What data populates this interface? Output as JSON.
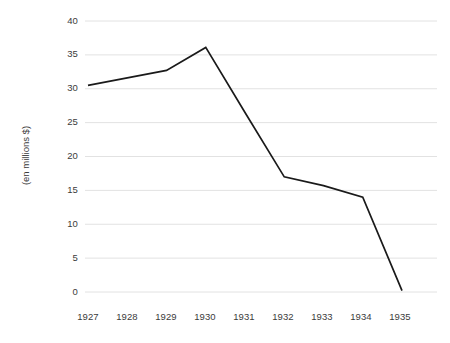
{
  "chart_data": {
    "type": "line",
    "title": "",
    "subtitle": "",
    "xlabel": "",
    "ylabel": "(en millions $)",
    "categories": [
      "1927",
      "1928",
      "1929",
      "1930",
      "1931",
      "1932",
      "1933",
      "1934",
      "1935"
    ],
    "x": [
      1927,
      1928,
      1929,
      1930,
      1931,
      1932,
      1933,
      1934,
      1935
    ],
    "values": [
      30.5,
      31.6,
      32.7,
      36.1,
      26.5,
      17.0,
      15.7,
      14.0,
      0.2
    ],
    "series": [
      {
        "name": "",
        "values": [
          30.5,
          31.6,
          32.7,
          36.1,
          26.5,
          17.0,
          15.7,
          14.0,
          0.2
        ]
      }
    ],
    "ylim": [
      0,
      40
    ],
    "yticks": [
      0,
      5,
      10,
      15,
      20,
      25,
      30,
      35,
      40
    ],
    "ytick_labels": [
      "0",
      "5",
      "10",
      "15",
      "20",
      "25",
      "30",
      "35",
      "40"
    ],
    "xtick_labels": [
      "1927",
      "1928",
      "1929",
      "1930",
      "1931",
      "1932",
      "1933",
      "1934",
      "1935"
    ],
    "grid": true,
    "grid_axis": "y",
    "legend": false,
    "legend_position": "none",
    "line_color": "#1a1a1a",
    "grid_color": "#e2e2e2",
    "background_color": "#ffffff",
    "text_color": "#3b3b3b",
    "annotations": []
  }
}
